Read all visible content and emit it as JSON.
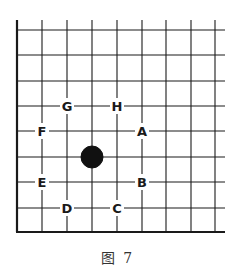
{
  "figure": {
    "caption": "图 7",
    "board": {
      "vertical_lines_x": [
        17,
        42,
        67,
        92,
        117,
        142,
        166,
        191,
        215
      ],
      "horizontal_lines_y": [
        30,
        55,
        81,
        106,
        131,
        157,
        182,
        208,
        232
      ],
      "thick_edges": [
        "left",
        "bottom"
      ],
      "line_color": "#1a1a1a",
      "stones": [
        {
          "color": "black",
          "x": 92,
          "y": 157
        }
      ],
      "labels": [
        {
          "text": "G",
          "x": 67,
          "y": 106
        },
        {
          "text": "H",
          "x": 117,
          "y": 106
        },
        {
          "text": "F",
          "x": 42,
          "y": 131
        },
        {
          "text": "A",
          "x": 142,
          "y": 131
        },
        {
          "text": "E",
          "x": 42,
          "y": 182
        },
        {
          "text": "B",
          "x": 142,
          "y": 182
        },
        {
          "text": "D",
          "x": 67,
          "y": 208
        },
        {
          "text": "C",
          "x": 117,
          "y": 208
        }
      ]
    }
  }
}
